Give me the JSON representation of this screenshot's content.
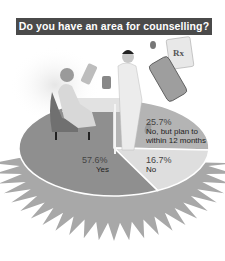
{
  "chart_data": {
    "type": "pie",
    "title": "Do you have an area for counselling?",
    "slices": [
      {
        "label": "Yes",
        "value": 57.6,
        "value_label": "57.6%",
        "color": "#8f8f8f"
      },
      {
        "label": "No, but plan to within 12 months",
        "value": 25.7,
        "value_label": "25.7%",
        "color": "#b4b4b4"
      },
      {
        "label": "No",
        "value": 16.7,
        "value_label": "16.7%",
        "color": "#dedede"
      }
    ],
    "label_lines": {
      "no_but_plan": [
        "No, but plan to",
        "within 12 months"
      ]
    },
    "illustration": "pharmacist-counselling-patient-with-rx-bottles",
    "rx_text": "Rx"
  }
}
